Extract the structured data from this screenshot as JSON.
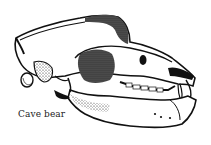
{
  "figure": {
    "caption": "Cave bear",
    "colors": {
      "background": "#ffffff",
      "ink": "#111111",
      "caption_text": "#222222"
    }
  }
}
